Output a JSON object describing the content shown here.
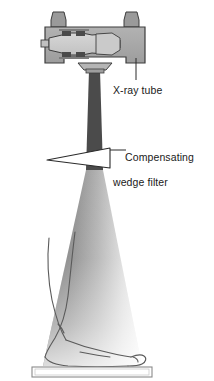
{
  "figure": {
    "domain": "diagram",
    "background_color": "#ffffff"
  },
  "labels": {
    "xray_tube": {
      "text": "X-ray tube",
      "leader": "vertical-line"
    },
    "wedge_filter": {
      "line1": "Compensating",
      "line2": "wedge filter",
      "leader": "horizontal-line"
    }
  },
  "components": {
    "tube_housing": {
      "name": "X-ray tube housing",
      "body_color": "#a8a8a8",
      "outline_color": "#3d3d3d",
      "insert_color": "#cfcfcf",
      "post_color": "#9a9a9a",
      "detail_color": "#4a4a4a"
    },
    "collimator": {
      "name": "collimator window",
      "color": "#b5b5b5",
      "outline_color": "#3d3d3d"
    },
    "beam_upper": {
      "name": "X-ray beam above filter",
      "color": "#4b4b4b"
    },
    "beam_lower": {
      "name": "X-ray beam below filter",
      "gradient_dark": "#707070",
      "gradient_light": "#ffffff"
    },
    "wedge": {
      "name": "Compensating wedge filter",
      "fill_color": "#ffffff",
      "outline_color": "#2b2b2b",
      "shape": "thin-triangle-thick-right"
    },
    "foot": {
      "name": "Patient foot and lower leg in profile",
      "outline_color": "#5a5a5a",
      "fill_color": "none"
    },
    "cassette": {
      "name": "Image receptor cassette",
      "fill_color": "#ffffff",
      "outline_color": "#8a8a8a"
    }
  },
  "colors": {
    "accent": "#4b4b4b",
    "text": "#1a1a1a",
    "outline": "#3d3d3d"
  }
}
